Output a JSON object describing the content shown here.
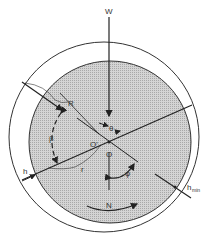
{
  "diagram": {
    "labels": {
      "load": "W",
      "radius": "R",
      "angle_beta": "β",
      "angle_theta": "θ",
      "bearing_center": "O",
      "journal_center": "O'",
      "radius_r": "r",
      "film_thickness": "h",
      "attitude_angle": "φ",
      "min_film_thickness": "h",
      "min_subscript": "min",
      "rotation": "N"
    },
    "colors": {
      "line": "#222222",
      "journal_fill": "#c8c8c8",
      "background": "#ffffff"
    }
  }
}
